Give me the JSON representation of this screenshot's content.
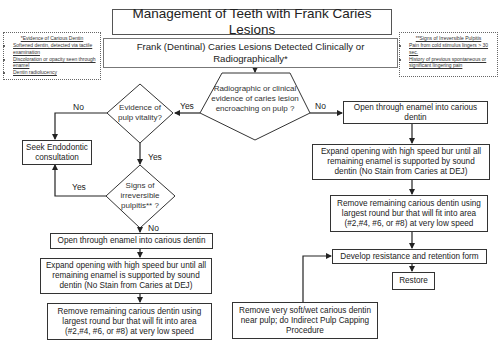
{
  "title": "Management of Teeth with Frank Caries Lesions",
  "start": "Frank (Dentinal) Caries Lesions Detected Clinically or Radiographically*",
  "notes": {
    "evidence": {
      "heading": "*Evidence of Carious Dentin",
      "items": [
        "Softened dentin, detected via tactile examination",
        "Discoloration or opacity seen through enamel",
        "Dentin radiolucency"
      ]
    },
    "irreversible": {
      "heading": "**Signs of Irreversible Pulpitis",
      "items": [
        "Pain from cold stimulus lingers > 30 sec.",
        "History of previous spontaneous or significant lingering pain"
      ]
    }
  },
  "decisions": {
    "encroaching": "Radiographic or clinical evidence of caries lesion encroaching on pulp ?",
    "vitality": "Evidence of pulp vitality?",
    "irreversible": "Signs of irreversible pulpitis** ?"
  },
  "labels": {
    "yes": "Yes",
    "no": "No"
  },
  "left_path": {
    "endo": "Seek Endodontic consultation",
    "open": "Open through enamel into carious dentin",
    "expand": "Expand opening with high speed bur until all remaining enamel is supported by sound dentin (No Stain from Caries at DEJ)",
    "remove": "Remove remaining carious dentin using largest round bur that will fit into area (#2,#4, #6, or #8) at very low speed"
  },
  "right_path": {
    "open": "Open through enamel into carious dentin",
    "expand": "Expand opening with high speed bur until all remaining enamel is supported by sound dentin (No Stain from Caries at DEJ)",
    "remove": "Remove remaining carious dentin using largest round bur that will fit into area (#2,#4, #6, or #8) at very low speed",
    "develop": "Develop resistance and retention form",
    "restore": "Restore"
  },
  "indirect_pulp": "Remove very soft/wet carious dentin near pulp; do Indirect Pulp Capping Procedure"
}
